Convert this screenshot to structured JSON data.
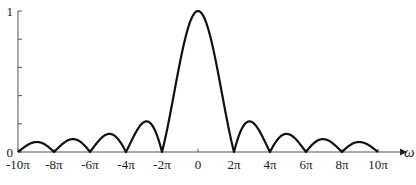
{
  "chart_data": {
    "type": "line",
    "title": "",
    "function": "|sin(ω/2)/(ω/2)|",
    "xlabel": "ω",
    "ylabel": "",
    "xlim": [
      -31.416,
      31.416
    ],
    "ylim": [
      0,
      1
    ],
    "x_ticks": [
      {
        "value": -31.416,
        "label": "-10π"
      },
      {
        "value": -25.133,
        "label": "-8π"
      },
      {
        "value": -18.85,
        "label": "-6π"
      },
      {
        "value": -12.566,
        "label": "-4π"
      },
      {
        "value": -6.283,
        "label": "-2π"
      },
      {
        "value": 0,
        "label": "0"
      },
      {
        "value": 6.283,
        "label": "2π"
      },
      {
        "value": 12.566,
        "label": "4π"
      },
      {
        "value": 18.85,
        "label": "6π"
      },
      {
        "value": 25.133,
        "label": "8π"
      },
      {
        "value": 31.416,
        "label": "10π"
      }
    ],
    "y_ticks": [
      {
        "value": 0,
        "label": "0"
      },
      {
        "value": 0.2,
        "label": ""
      },
      {
        "value": 0.4,
        "label": ""
      },
      {
        "value": 0.6,
        "label": ""
      },
      {
        "value": 0.8,
        "label": ""
      },
      {
        "value": 1,
        "label": "1"
      }
    ],
    "series": [
      {
        "name": "|sinc|",
        "x_over_pi": [
          -10,
          -9,
          -8,
          -7,
          -6,
          -5,
          -4,
          -3,
          -2,
          -1,
          0,
          1,
          2,
          3,
          4,
          5,
          6,
          7,
          8,
          9,
          10
        ],
        "values": [
          0,
          0.071,
          0,
          0.091,
          0,
          0.127,
          0,
          0.212,
          0,
          0.637,
          1,
          0.637,
          0,
          0.212,
          0,
          0.127,
          0,
          0.091,
          0,
          0.071,
          0
        ]
      }
    ],
    "grid": false,
    "legend": null
  },
  "layout": {
    "x_origin_px": 198,
    "px_per_pi": 18,
    "y_zero_px": 152,
    "y_one_px": 11,
    "line_color": "#111111",
    "axis_color": "#555555"
  }
}
